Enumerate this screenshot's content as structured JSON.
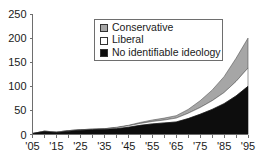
{
  "chart_data": {
    "type": "area",
    "stacked": true,
    "title": "",
    "subtitle": "",
    "xlabel": "",
    "ylabel": "",
    "xlim": [
      1905,
      1995
    ],
    "ylim": [
      0,
      250
    ],
    "ytick_values": [
      0,
      50,
      100,
      150,
      200,
      250
    ],
    "ytick_labels": [
      "0",
      "50",
      "100",
      "150",
      "200",
      "250"
    ],
    "xtick_values": [
      1905,
      1915,
      1925,
      1935,
      1945,
      1955,
      1965,
      1975,
      1985,
      1995
    ],
    "xtick_labels": [
      "'05",
      "'15",
      "'25",
      "'35",
      "'45",
      "'55",
      "'65",
      "'75",
      "'85",
      "'95"
    ],
    "minor_xtick_values": [
      1910,
      1920,
      1930,
      1940,
      1950,
      1960,
      1970,
      1980,
      1990
    ],
    "grid": false,
    "legend_position": "top-center",
    "x": [
      1905,
      1910,
      1915,
      1920,
      1925,
      1930,
      1935,
      1940,
      1945,
      1950,
      1955,
      1960,
      1965,
      1970,
      1975,
      1980,
      1985,
      1990,
      1995
    ],
    "series": [
      {
        "name": "No identifiable ideology",
        "color": "#0d0d0d",
        "values": [
          2,
          6,
          4,
          7,
          9,
          10,
          11,
          12,
          15,
          19,
          22,
          24,
          26,
          33,
          42,
          52,
          64,
          80,
          100
        ]
      },
      {
        "name": "Liberal",
        "color": "#ffffff",
        "values": [
          0,
          1,
          1,
          1,
          1,
          1,
          1,
          2,
          3,
          4,
          5,
          6,
          8,
          11,
          14,
          18,
          23,
          30,
          38
        ]
      },
      {
        "name": "Conservative",
        "color": "#a6a6a6",
        "values": [
          0,
          0,
          0,
          0,
          0,
          0,
          0,
          1,
          1,
          2,
          3,
          4,
          5,
          8,
          14,
          22,
          33,
          48,
          62
        ]
      }
    ],
    "stack_totals": [
      2,
      7,
      5,
      8,
      10,
      11,
      12,
      15,
      19,
      25,
      30,
      34,
      39,
      52,
      70,
      92,
      120,
      158,
      200
    ]
  },
  "legend": {
    "entries": [
      {
        "label": "Conservative",
        "swatch_color": "#a6a6a6",
        "icon": "square-swatch-gray"
      },
      {
        "label": "Liberal",
        "swatch_color": "#ffffff",
        "icon": "square-swatch-white"
      },
      {
        "label": "No identifiable ideology",
        "swatch_color": "#0d0d0d",
        "icon": "square-swatch-black"
      }
    ]
  },
  "axis": {
    "line_color": "#6e6e6e"
  }
}
